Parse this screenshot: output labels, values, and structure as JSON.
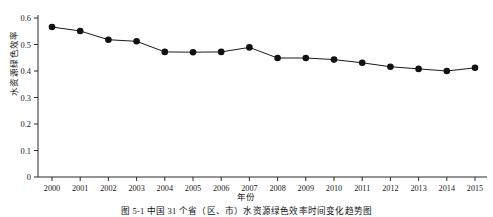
{
  "figure": {
    "caption": "图 5-1  中国 31 个省（区、市）水资源绿色效率时间变化趋势图"
  },
  "chart_data": {
    "type": "line",
    "title": "",
    "xlabel": "年份",
    "ylabel": "水资源绿色效率",
    "categories": [
      "2000",
      "2001",
      "2002",
      "2003",
      "2004",
      "2005",
      "2006",
      "2007",
      "2008",
      "2009",
      "2010",
      "2011",
      "2012",
      "2013",
      "2014",
      "2015"
    ],
    "x": [
      2000,
      2001,
      2002,
      2003,
      2004,
      2005,
      2006,
      2007,
      2008,
      2009,
      2010,
      2011,
      2012,
      2013,
      2014,
      2015
    ],
    "values": [
      0.566,
      0.551,
      0.518,
      0.512,
      0.472,
      0.471,
      0.472,
      0.489,
      0.449,
      0.449,
      0.443,
      0.431,
      0.416,
      0.408,
      0.4,
      0.412
    ],
    "series": [
      {
        "name": "水资源绿色效率",
        "values": [
          0.566,
          0.551,
          0.518,
          0.512,
          0.472,
          0.471,
          0.472,
          0.489,
          0.449,
          0.449,
          0.443,
          0.431,
          0.416,
          0.408,
          0.4,
          0.412
        ]
      }
    ],
    "ylim": [
      0,
      0.6
    ],
    "yticks": [
      0,
      0.1,
      0.2,
      0.3,
      0.4,
      0.5,
      0.6
    ],
    "ytick_labels": [
      "0",
      "0.1",
      "0.2",
      "0.3",
      "0.4",
      "0.5",
      "0.6"
    ],
    "grid": false,
    "legend": false,
    "marker": "filled-circle",
    "line_color": "#1a1a1a",
    "marker_color": "#111111"
  }
}
